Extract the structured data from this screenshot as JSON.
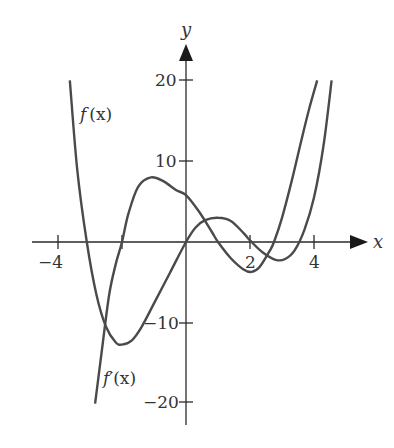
{
  "chart_data": {
    "type": "line",
    "title": "",
    "xlabel": "x",
    "ylabel": "y",
    "xlim": [
      -4.5,
      5
    ],
    "ylim": [
      -22,
      25
    ],
    "grid": false,
    "legend": "inline labels",
    "x_ticks": [
      -4,
      2,
      4
    ],
    "x_tick_labels": [
      "−4",
      "2",
      "4"
    ],
    "x_ticks_unlabeled": [
      -2
    ],
    "y_ticks": [
      20,
      10,
      -10,
      -20
    ],
    "y_tick_labels": [
      "20",
      "10",
      "−10",
      "−20"
    ],
    "series": [
      {
        "name": "f(x)",
        "label_position": [
          -3.2,
          16
        ],
        "points": [
          [
            -3.63,
            20
          ],
          [
            -3.4,
            9
          ],
          [
            -3.1,
            0
          ],
          [
            -2.8,
            -6.5
          ],
          [
            -2.5,
            -10.5
          ],
          [
            -2.2,
            -12.4
          ],
          [
            -2.0,
            -12.7
          ],
          [
            -1.7,
            -12.2
          ],
          [
            -1.4,
            -10.6
          ],
          [
            -1.0,
            -7.6
          ],
          [
            -0.5,
            -3.8
          ],
          [
            0,
            0
          ],
          [
            0.3,
            1.8
          ],
          [
            0.6,
            2.7
          ],
          [
            1.0,
            3.0
          ],
          [
            1.4,
            2.6
          ],
          [
            1.8,
            1.1
          ],
          [
            2.0,
            0.2
          ],
          [
            2.4,
            -1.3
          ],
          [
            2.8,
            -2.2
          ],
          [
            3.1,
            -2.1
          ],
          [
            3.4,
            -1.0
          ],
          [
            3.7,
            1.5
          ],
          [
            4.0,
            5.5
          ],
          [
            4.3,
            12.0
          ],
          [
            4.55,
            20
          ]
        ]
      },
      {
        "name": "f′(x)",
        "label_position": [
          -2.5,
          -15.5
        ],
        "points": [
          [
            -2.84,
            -20
          ],
          [
            -2.6,
            -12.5
          ],
          [
            -2.4,
            -6.5
          ],
          [
            -2.2,
            -2.8
          ],
          [
            -2.0,
            0
          ],
          [
            -1.8,
            3.5
          ],
          [
            -1.5,
            6.8
          ],
          [
            -1.1,
            8.0
          ],
          [
            -0.7,
            7.5
          ],
          [
            -0.3,
            6.4
          ],
          [
            0,
            5.8
          ],
          [
            0.4,
            3.8
          ],
          [
            0.8,
            1.3
          ],
          [
            1.0,
            0
          ],
          [
            1.4,
            -2.0
          ],
          [
            1.8,
            -3.4
          ],
          [
            2.05,
            -3.7
          ],
          [
            2.3,
            -3.1
          ],
          [
            2.6,
            -1.2
          ],
          [
            2.75,
            0
          ],
          [
            3.0,
            3.0
          ],
          [
            3.3,
            7.5
          ],
          [
            3.6,
            12.5
          ],
          [
            3.85,
            16.5
          ],
          [
            4.1,
            20
          ]
        ]
      }
    ]
  },
  "axes": {
    "x_label": "x",
    "y_label": "y"
  },
  "labels": {
    "f": "f",
    "f_arg": "(x)",
    "fprime": "f′",
    "fprime_arg": "(x)"
  },
  "ticks": {
    "x_neg4": "−4",
    "x_2": "2",
    "x_4": "4",
    "y_20": "20",
    "y_10": "10",
    "y_neg10": "−10",
    "y_neg20": "−20"
  },
  "colors": {
    "curve": "#4a4a4a",
    "axis": "#2a2a2a",
    "text": "#333333",
    "background": "#ffffff"
  }
}
